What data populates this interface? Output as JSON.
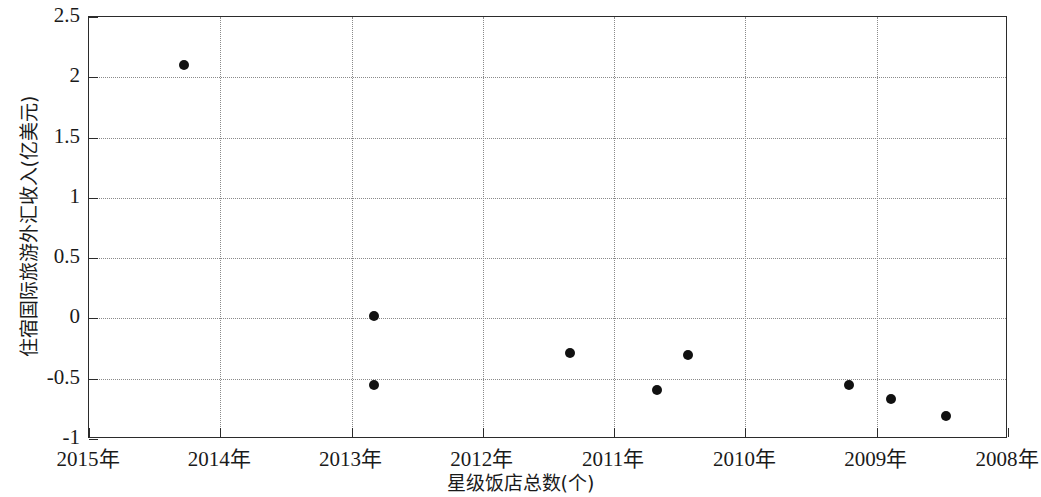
{
  "chart_data": {
    "type": "scatter",
    "title": "",
    "xlabel": "星级饭店总数(个)",
    "ylabel": "住宿国际旅游外汇收入(亿美元)",
    "grid": true,
    "legend": null,
    "x_is_categorical_years": true,
    "x_tick_labels": [
      "2015年",
      "2014年",
      "2013年",
      "2012年",
      "2011年",
      "2010年",
      "2009年",
      "2008年"
    ],
    "x_tick_values": [
      2015,
      2014,
      2013,
      2012,
      2011,
      2010,
      2009,
      2008
    ],
    "xlim": [
      2015,
      2008
    ],
    "y_tick_labels": [
      "2.5",
      "2",
      "1.5",
      "1",
      "0.5",
      "0",
      "-0.5",
      "-1"
    ],
    "y_tick_values": [
      2.5,
      2,
      1.5,
      1,
      0.5,
      0,
      -0.5,
      -1
    ],
    "ylim": [
      -1,
      2.5
    ],
    "marker": "filled-circle",
    "marker_color": "#111111",
    "points": [
      {
        "x": 2014.28,
        "y": 2.1
      },
      {
        "x": 2012.83,
        "y": 0.02
      },
      {
        "x": 2012.83,
        "y": -0.55
      },
      {
        "x": 2011.34,
        "y": -0.29
      },
      {
        "x": 2010.67,
        "y": -0.59
      },
      {
        "x": 2010.44,
        "y": -0.3
      },
      {
        "x": 2009.21,
        "y": -0.55
      },
      {
        "x": 2008.89,
        "y": -0.67
      },
      {
        "x": 2008.47,
        "y": -0.81
      }
    ]
  },
  "axes": {
    "plot_left_px": 88,
    "plot_top_px": 16,
    "plot_width_px": 919,
    "plot_height_px": 422
  }
}
